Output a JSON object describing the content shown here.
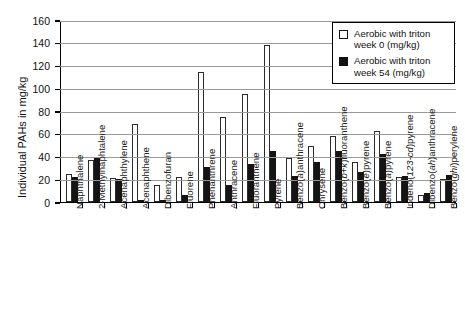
{
  "chart_data": {
    "type": "bar",
    "title": "",
    "xlabel": "",
    "ylabel": "Individual PAHs in mg/kg",
    "ylim": [
      0,
      160
    ],
    "ytick_values": [
      0,
      20,
      40,
      60,
      80,
      100,
      120,
      140,
      160
    ],
    "grid": true,
    "legend_position": "top-right",
    "categories": [
      "Naphthalene",
      "2-Methylnaphtalene",
      "Acenaphthylene",
      "Acenaphthene",
      "Dibenzofuran",
      "Fluorene",
      "Phenanthrene",
      "Anthracene",
      "Fluoranthene",
      "Pyrene",
      "Benzo(a)anthracene",
      "Chrysene",
      "Benzo(b+k)fluoranthene",
      "Benzo(e)pyrene",
      "Benzo(a)pyrene",
      "Indeno(123-cd)pyrene",
      "Dibenzo(ah)anthracene",
      "Benzo(ghi)perylene"
    ],
    "series": [
      {
        "name": "Aerobic with triton week 0 (mg/kg)",
        "color": "#ffffff",
        "values": [
          25,
          37,
          21,
          69,
          15,
          22,
          114,
          75,
          95,
          138,
          39,
          49,
          58,
          35,
          62,
          22,
          6,
          20
        ]
      },
      {
        "name": "Aerobic with triton week 54 (mg/kg)",
        "color": "#141414",
        "values": [
          22,
          39,
          20,
          2,
          2,
          6,
          31,
          15,
          33,
          45,
          23,
          35,
          45,
          26,
          42,
          23,
          8,
          24
        ]
      }
    ]
  },
  "legend": {
    "items": [
      {
        "label_line1": "Aerobic with triton",
        "label_line2": "week 0 (mg/kg)"
      },
      {
        "label_line1": "Aerobic with triton",
        "label_line2": "week 54 (mg/kg)"
      }
    ]
  },
  "axis": {
    "y_title": "Individual PAHs in mg/kg"
  }
}
